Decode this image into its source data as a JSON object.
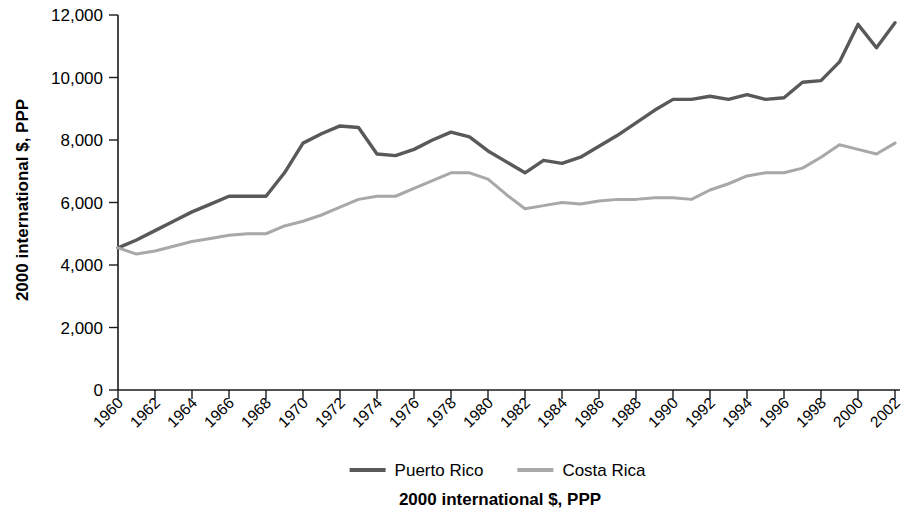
{
  "chart_data": {
    "type": "line",
    "title": "",
    "xlabel": "2000 international $, PPP",
    "ylabel": "2000 international $, PPP",
    "xlim": [
      1960,
      2002
    ],
    "ylim": [
      0,
      12000
    ],
    "yticks": [
      0,
      2000,
      4000,
      6000,
      8000,
      10000,
      12000
    ],
    "ytick_labels": [
      "0",
      "2,000",
      "4,000",
      "6,000",
      "8,000",
      "10,000",
      "12,000"
    ],
    "xticks": [
      1960,
      1962,
      1964,
      1966,
      1968,
      1970,
      1972,
      1974,
      1976,
      1978,
      1980,
      1982,
      1984,
      1986,
      1988,
      1990,
      1992,
      1994,
      1996,
      1998,
      2000,
      2002
    ],
    "xtick_labels": [
      "1960",
      "1962",
      "1964",
      "1966",
      "1968",
      "1970",
      "1972",
      "1974",
      "1976",
      "1978",
      "1980",
      "1982",
      "1984",
      "1986",
      "1988",
      "1990",
      "1992",
      "1994",
      "1996",
      "1998",
      "2000",
      "2002"
    ],
    "grid": false,
    "legend_position": "bottom",
    "x": [
      1960,
      1961,
      1962,
      1963,
      1964,
      1965,
      1966,
      1967,
      1968,
      1969,
      1970,
      1971,
      1972,
      1973,
      1974,
      1975,
      1976,
      1977,
      1978,
      1979,
      1980,
      1981,
      1982,
      1983,
      1984,
      1985,
      1986,
      1987,
      1988,
      1989,
      1990,
      1991,
      1992,
      1993,
      1994,
      1995,
      1996,
      1997,
      1998,
      1999,
      2000,
      2001,
      2002
    ],
    "series": [
      {
        "name": "Puerto Rico",
        "color": "#595959",
        "values": [
          4550,
          4800,
          5100,
          5400,
          5700,
          5950,
          6200,
          6200,
          6200,
          6950,
          7900,
          8200,
          8450,
          8400,
          7550,
          7500,
          7700,
          8000,
          8250,
          8100,
          7650,
          7300,
          6950,
          7350,
          7250,
          7450,
          7800,
          8150,
          8550,
          8950,
          9300,
          9300,
          9400,
          9300,
          9450,
          9300,
          9350,
          9850,
          9900,
          10500,
          11700,
          10950,
          11750
        ]
      },
      {
        "name": "Costa Rica",
        "color": "#a8a8a8",
        "values": [
          4550,
          4350,
          4450,
          4600,
          4750,
          4850,
          4950,
          5000,
          5000,
          5250,
          5400,
          5600,
          5850,
          6100,
          6200,
          6200,
          6450,
          6700,
          6950,
          6950,
          6750,
          6250,
          5800,
          5900,
          6000,
          5950,
          6050,
          6100,
          6100,
          6150,
          6150,
          6100,
          6400,
          6600,
          6850,
          6950,
          6950,
          7100,
          7450,
          7850,
          7700,
          7550,
          7900
        ]
      }
    ]
  },
  "legend": {
    "items": [
      {
        "label": "Puerto Rico",
        "color": "#595959"
      },
      {
        "label": "Costa Rica",
        "color": "#a8a8a8"
      }
    ]
  },
  "axis_titles": {
    "y": "2000 international $, PPP",
    "x": "2000 international $, PPP"
  }
}
